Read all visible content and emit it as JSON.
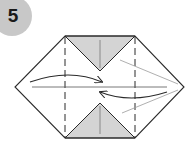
{
  "step": {
    "number": "5",
    "badge_color": "#c8c8c8"
  },
  "diagram": {
    "fill_shaded": "#d4d4d4",
    "line_color": "#2a2a2a",
    "guide_color": "#9a9a9a"
  }
}
